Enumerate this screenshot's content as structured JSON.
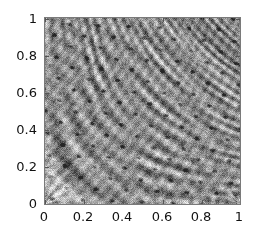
{
  "figure": {
    "type": "density-plot",
    "background_color": "#ffffff",
    "frame_color": "#7a7a7a",
    "colormap": "grayscale"
  },
  "chart_data": {
    "type": "heatmap",
    "title": "",
    "subtitle": "",
    "xlabel": "",
    "ylabel": "",
    "xlim": [
      0,
      1
    ],
    "ylim": [
      0,
      1
    ],
    "grid": false,
    "legend": null,
    "colormap": "grayscale",
    "colorbar": false,
    "annotations": [],
    "x_ticks": [
      0,
      0.2,
      0.4,
      0.6,
      0.8,
      1
    ],
    "y_ticks": [
      0,
      0.2,
      0.4,
      0.6,
      0.8,
      1
    ],
    "x_tick_labels": [
      "0",
      "0.2",
      "0.4",
      "0.6",
      "0.8",
      "1"
    ],
    "y_tick_labels": [
      "0",
      "0.2",
      "0.4",
      "0.6",
      "0.8",
      "1"
    ],
    "value_range": [
      0,
      1
    ],
    "features": [
      {
        "name": "lower-left-fan",
        "x": 0.0,
        "y": 0.0,
        "kind": "radiating-streaks"
      },
      {
        "name": "lower-right-fan",
        "x": 1.0,
        "y": 0.0,
        "kind": "radiating-streaks"
      },
      {
        "name": "bottom-band",
        "x": 0.85,
        "y": 0.05,
        "kind": "vertical-banding"
      },
      {
        "name": "interior-speckle",
        "x": 0.5,
        "y": 0.6,
        "kind": "dark-ellipse-field"
      }
    ]
  },
  "axes": {
    "x": {
      "ticks": [
        {
          "value": 0,
          "label": "0"
        },
        {
          "value": 0.2,
          "label": "0.2"
        },
        {
          "value": 0.4,
          "label": "0.4"
        },
        {
          "value": 0.6,
          "label": "0.6"
        },
        {
          "value": 0.8,
          "label": "0.8"
        },
        {
          "value": 1,
          "label": "1"
        }
      ]
    },
    "y": {
      "ticks": [
        {
          "value": 0,
          "label": "0"
        },
        {
          "value": 0.2,
          "label": "0.2"
        },
        {
          "value": 0.4,
          "label": "0.4"
        },
        {
          "value": 0.6,
          "label": "0.6"
        },
        {
          "value": 0.8,
          "label": "0.8"
        },
        {
          "value": 1,
          "label": "1"
        }
      ]
    }
  }
}
